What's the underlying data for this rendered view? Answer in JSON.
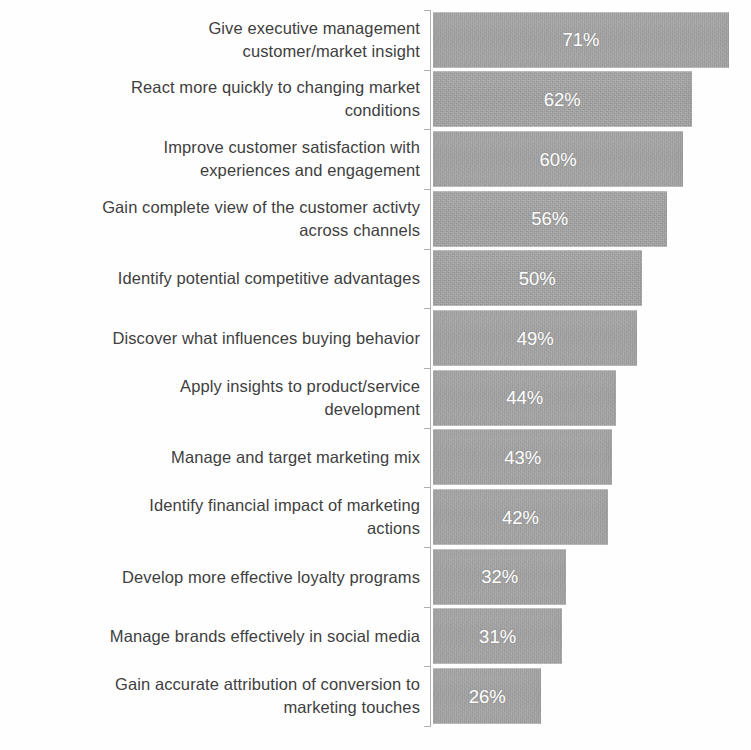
{
  "chart_data": {
    "type": "bar",
    "orientation": "horizontal",
    "title": "",
    "subtitle": "",
    "xlabel": "",
    "ylabel": "",
    "xlim": [
      0,
      75
    ],
    "grid": false,
    "legend": null,
    "legend_position": "none",
    "value_label_format": "{v}%",
    "value_label_position": "inside-center",
    "value_label_color": "#ffffff",
    "bar_color": "#a3a3a3",
    "label_color": "#3f3f3f",
    "axis_color": "#b2b2b2",
    "background_color": "#ffffff",
    "axis_ticks_visible": true,
    "value_axis_ticks_visible": false,
    "categories": [
      "Give executive management customer/market insight",
      "React more quickly to changing market conditions",
      "Improve customer satisfaction with experiences and engagement",
      "Gain complete view of the customer activty across channels",
      "Identify potential competitive advantages",
      "Discover what influences buying behavior",
      "Apply insights to product/service development",
      "Manage and target marketing mix",
      "Identify financial impact of marketing actions",
      "Develop more effective loyalty programs",
      "Manage brands effectively in social media",
      "Gain accurate attribution of conversion to marketing touches"
    ],
    "values": [
      71,
      62,
      60,
      56,
      50,
      49,
      44,
      43,
      42,
      32,
      31,
      26
    ],
    "value_labels": [
      "71%",
      "62%",
      "60%",
      "56%",
      "50%",
      "49%",
      "44%",
      "43%",
      "42%",
      "32%",
      "31%",
      "26%"
    ]
  },
  "rows": [
    {
      "label_lines": [
        "Give executive management",
        "customer/market insight"
      ],
      "value": 71,
      "value_label": "71%"
    },
    {
      "label_lines": [
        "React more quickly to changing market",
        "conditions"
      ],
      "value": 62,
      "value_label": "62%"
    },
    {
      "label_lines": [
        "Improve customer satisfaction with",
        "experiences and engagement"
      ],
      "value": 60,
      "value_label": "60%"
    },
    {
      "label_lines": [
        "Gain complete view of the customer activty",
        "across channels"
      ],
      "value": 56,
      "value_label": "56%"
    },
    {
      "label_lines": [
        "Identify potential competitive advantages"
      ],
      "value": 50,
      "value_label": "50%"
    },
    {
      "label_lines": [
        "Discover what influences buying behavior"
      ],
      "value": 49,
      "value_label": "49%"
    },
    {
      "label_lines": [
        "Apply insights to product/service",
        "development"
      ],
      "value": 44,
      "value_label": "44%"
    },
    {
      "label_lines": [
        "Manage and target marketing mix"
      ],
      "value": 43,
      "value_label": "43%"
    },
    {
      "label_lines": [
        "Identify financial impact of marketing",
        "actions"
      ],
      "value": 42,
      "value_label": "42%"
    },
    {
      "label_lines": [
        "Develop more effective loyalty programs"
      ],
      "value": 32,
      "value_label": "32%"
    },
    {
      "label_lines": [
        "Manage brands effectively in social media"
      ],
      "value": 31,
      "value_label": "31%"
    },
    {
      "label_lines": [
        "Gain accurate attribution of conversion to",
        "marketing touches"
      ],
      "value": 26,
      "value_label": "26%"
    }
  ]
}
